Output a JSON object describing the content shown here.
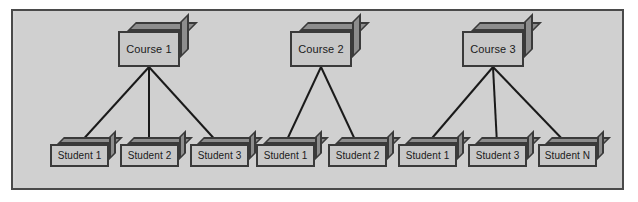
{
  "diagram": {
    "panel": {
      "background_color": "#d2d2d2",
      "border_color": "#4a4a4a"
    },
    "node_style": {
      "face_color": "#c8c8c8",
      "shade_color": "#8d8d8d",
      "outline_color": "#3a3a3a",
      "edge_color": "#1a1a1a"
    },
    "courses": [
      {
        "id": "course-1",
        "label": "Course 1",
        "x": 118,
        "y": 31,
        "anchor_x": 149,
        "anchor_y": 67
      },
      {
        "id": "course-2",
        "label": "Course 2",
        "x": 290,
        "y": 31,
        "anchor_x": 321,
        "anchor_y": 67
      },
      {
        "id": "course-3",
        "label": "Course 3",
        "x": 462,
        "y": 31,
        "anchor_x": 493,
        "anchor_y": 67
      }
    ],
    "students": [
      {
        "id": "student-1-1",
        "label": "Student 1",
        "course": "course-1",
        "x": 50,
        "y": 144,
        "anchor_x": 79,
        "anchor_y": 144
      },
      {
        "id": "student-1-2",
        "label": "Student 2",
        "course": "course-1",
        "x": 120,
        "y": 144,
        "anchor_x": 149,
        "anchor_y": 144
      },
      {
        "id": "student-1-3",
        "label": "Student 3",
        "course": "course-1",
        "x": 190,
        "y": 144,
        "anchor_x": 219,
        "anchor_y": 144
      },
      {
        "id": "student-2-1",
        "label": "Student 1",
        "course": "course-2",
        "x": 256,
        "y": 144,
        "anchor_x": 285,
        "anchor_y": 144
      },
      {
        "id": "student-2-2",
        "label": "Student 2",
        "course": "course-2",
        "x": 328,
        "y": 144,
        "anchor_x": 357,
        "anchor_y": 144
      },
      {
        "id": "student-3-1",
        "label": "Student 1",
        "course": "course-3",
        "x": 398,
        "y": 144,
        "anchor_x": 427,
        "anchor_y": 144
      },
      {
        "id": "student-3-2",
        "label": "Student 3",
        "course": "course-3",
        "x": 468,
        "y": 144,
        "anchor_x": 497,
        "anchor_y": 144
      },
      {
        "id": "student-3-N",
        "label": "Student N",
        "course": "course-3",
        "x": 538,
        "y": 144,
        "anchor_x": 567,
        "anchor_y": 144
      }
    ],
    "edges": [
      {
        "from": "course-1",
        "to": "student-1-1"
      },
      {
        "from": "course-1",
        "to": "student-1-2"
      },
      {
        "from": "course-1",
        "to": "student-1-3"
      },
      {
        "from": "course-2",
        "to": "student-2-1"
      },
      {
        "from": "course-2",
        "to": "student-2-2"
      },
      {
        "from": "course-3",
        "to": "student-3-1"
      },
      {
        "from": "course-3",
        "to": "student-3-2"
      },
      {
        "from": "course-3",
        "to": "student-3-N"
      }
    ]
  }
}
